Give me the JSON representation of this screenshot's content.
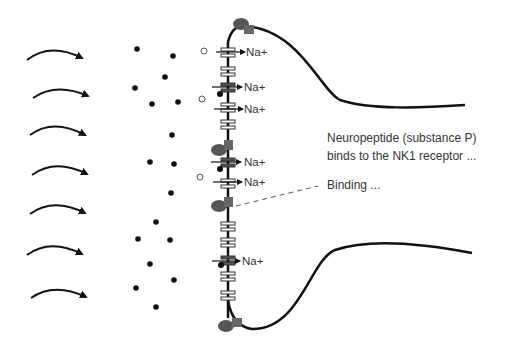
{
  "diagram": {
    "annotation": {
      "line1": "Neuropeptide (substance P)",
      "line2": "binds to the NK1 receptor ...",
      "binding": "Binding ..."
    },
    "ion_label": "Na+",
    "colors": {
      "line": "#111111",
      "receptor_ellipse": "#555555",
      "receptor_square": "#666666",
      "channel_fill": "#ffffff",
      "channel_active_fill": "#555555",
      "text": "#333333",
      "dashed": "#555555"
    },
    "flow_arrows": 7,
    "na_channels": [
      "Na+",
      "Na+",
      "Na+",
      "Na+",
      "Na+",
      "Na+"
    ]
  }
}
